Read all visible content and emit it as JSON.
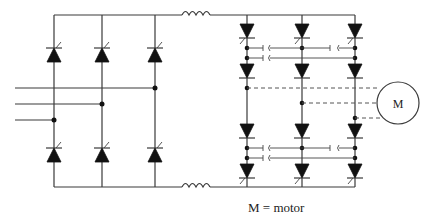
{
  "diagram": {
    "motor": {
      "symbol": "M"
    },
    "caption": "M = motor",
    "components": {
      "left_bridge": {
        "type": "6-thyristor rectifier bridge",
        "columns": 3,
        "ac_inputs": 3
      },
      "dc_link": {
        "inductors": 2
      },
      "right_bridge": {
        "type": "inverter with anti-parallel thyristor pairs and commutation capacitors",
        "columns": 3
      },
      "motor_connections": 3
    },
    "colors": {
      "line": "#3a3a3a",
      "device": "#111111",
      "background": "#ffffff"
    }
  }
}
